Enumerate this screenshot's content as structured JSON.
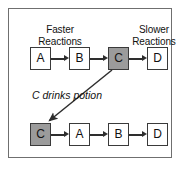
{
  "figure": {
    "frame_color": "#6f6f6f",
    "background": "#ffffff",
    "shaded_fill": "#9b9b9b",
    "line_color": "#2e2e2e"
  },
  "headings": {
    "left": {
      "line1": "Faster",
      "line2": "Reactions"
    },
    "right": {
      "line1": "Slower",
      "line2": "Reactions"
    }
  },
  "rows": [
    {
      "id": "before",
      "nodes": [
        {
          "label": "A",
          "shaded": false
        },
        {
          "label": "B",
          "shaded": false
        },
        {
          "label": "C",
          "shaded": true
        },
        {
          "label": "D",
          "shaded": false
        }
      ]
    },
    {
      "id": "after",
      "nodes": [
        {
          "label": "C",
          "shaded": true
        },
        {
          "label": "A",
          "shaded": false
        },
        {
          "label": "B",
          "shaded": false
        },
        {
          "label": "D",
          "shaded": false
        }
      ]
    }
  ],
  "caption": "C drinks potion"
}
